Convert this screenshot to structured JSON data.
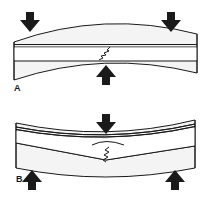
{
  "figure": {
    "colors": {
      "ink": "#1a1a1a",
      "fill": "#f4f4f4",
      "background": "#ffffff"
    },
    "panels": [
      {
        "label": "A",
        "loading": "two downward loads at ends, one upward support at center",
        "arrows": [
          {
            "direction": "down",
            "position": "left"
          },
          {
            "direction": "down",
            "position": "right"
          },
          {
            "direction": "up",
            "position": "center"
          }
        ],
        "crack": "zigzag crack across middle layer at center"
      },
      {
        "label": "B",
        "loading": "one downward load at center, two upward supports at ends",
        "arrows": [
          {
            "direction": "down",
            "position": "center"
          },
          {
            "direction": "up",
            "position": "left"
          },
          {
            "direction": "up",
            "position": "right"
          }
        ],
        "crack": "zigzag crack through lower layer at center with V-shaped fold"
      }
    ]
  }
}
